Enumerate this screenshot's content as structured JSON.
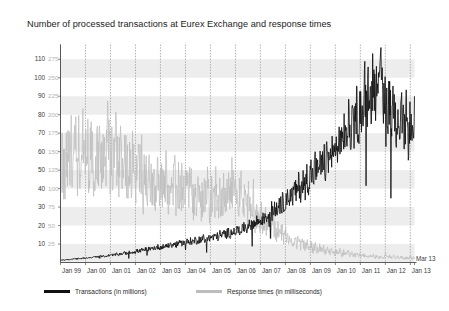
{
  "chart_data": {
    "type": "line",
    "title": "Number of processed transactions at Eurex Exchange and response times",
    "xlabel": "",
    "ylabel": "",
    "grid": true,
    "legend_position": "bottom",
    "axis_left": {
      "label": "Transactions (in millions)",
      "ticks": [
        10,
        20,
        30,
        40,
        50,
        60,
        70,
        80,
        90,
        100,
        110
      ],
      "ylim": [
        0,
        118
      ]
    },
    "axis_right": {
      "label": "Response times (in milliseconds)",
      "ticks": [
        25,
        50,
        75,
        100,
        125,
        150,
        175,
        200,
        225,
        250,
        275
      ],
      "ylim": [
        0,
        295
      ]
    },
    "x_ticks": [
      "Jan 99",
      "Jan 00",
      "Jan 01",
      "Jan 02",
      "Jan 03",
      "Jan 04",
      "Jan 05",
      "Jan 06",
      "Jan 07",
      "Jan 08",
      "Jan 09",
      "Jan 10",
      "Jan 11",
      "Jan 12",
      "Jan 13"
    ],
    "x_end_label": "Mar 13",
    "xlim": [
      "Jan 99",
      "Mar 13"
    ],
    "colors": {
      "transactions": "#111111",
      "response_times": "#bdbdbd",
      "band": "#ededed",
      "gridline": "#9a9a9a",
      "background": "#ffffff"
    },
    "series": [
      {
        "name": "Transactions (in millions)",
        "axis": "left",
        "color": "#111111",
        "unit": "millions",
        "values": [
          1.2,
          1.4,
          1.3,
          1.6,
          1.5,
          1.8,
          1.7,
          2.0,
          1.9,
          2.2,
          2.1,
          2.4,
          2.3,
          2.6,
          2.5,
          2.9,
          2.7,
          3.1,
          3.0,
          3.3,
          3.2,
          3.6,
          3.4,
          3.8,
          3.7,
          4.2,
          4.0,
          4.5,
          4.3,
          4.8,
          4.6,
          5.2,
          5.0,
          5.5,
          5.3,
          5.9,
          5.6,
          6.3,
          6.0,
          6.8,
          6.4,
          7.2,
          6.9,
          7.6,
          7.3,
          8.1,
          7.8,
          8.5,
          8.0,
          8.8,
          8.4,
          9.3,
          8.9,
          9.7,
          9.2,
          10.1,
          9.6,
          10.6,
          10.0,
          11.0,
          10.4,
          11.3,
          10.8,
          11.8,
          11.2,
          12.2,
          11.6,
          12.6,
          12.0,
          13.1,
          12.5,
          13.5,
          12.9,
          14.0,
          13.4,
          14.6,
          13.9,
          15.2,
          14.4,
          15.8,
          15.0,
          16.4,
          15.6,
          17.0,
          16.2,
          17.8,
          16.9,
          18.6,
          17.6,
          19.5,
          18.3,
          20.4,
          19.2,
          21.5,
          20.3,
          22.8,
          21.6,
          24.5,
          23.0,
          26.0,
          24.5,
          27.5,
          26.0,
          29.0,
          27.5,
          31.0,
          29.5,
          33.0,
          31.5,
          35.5,
          33.5,
          38.0,
          35.0,
          40.0,
          37.0,
          42.5,
          39.0,
          45.0,
          41.0,
          47.0,
          43.0,
          50.0,
          45.0,
          53.0,
          47.0,
          56.0,
          49.0,
          58.0,
          51.0,
          60.0,
          53.0,
          62.0,
          55.0,
          66.0,
          58.0,
          70.0,
          61.0,
          74.0,
          64.0,
          78.0,
          67.0,
          82.0,
          70.0,
          86.0,
          72.0,
          90.0,
          75.0,
          95.0,
          78.0,
          100.0,
          82.0,
          106.0,
          86.0,
          113.0,
          88.0,
          104.0,
          84.0,
          96.0,
          80.0,
          92.0,
          76.0,
          88.0,
          72.0,
          85.0,
          70.0,
          82.0,
          68.0,
          80.0,
          66.0,
          78.0,
          64.0,
          90.0
        ],
        "peak_value": 113,
        "peak_period": "Aug 2011",
        "end_value": 90,
        "start_value": 1.2
      },
      {
        "name": "Response times (in milliseconds)",
        "axis": "right",
        "color": "#bdbdbd",
        "unit": "milliseconds",
        "values": [
          120,
          135,
          118,
          150,
          128,
          160,
          140,
          175,
          132,
          155,
          145,
          168,
          138,
          158,
          126,
          172,
          130,
          148,
          142,
          165,
          122,
          152,
          136,
          170,
          128,
          145,
          134,
          162,
          118,
          140,
          125,
          155,
          112,
          132,
          120,
          148,
          105,
          128,
          115,
          138,
          98,
          120,
          108,
          130,
          95,
          118,
          102,
          125,
          90,
          112,
          96,
          120,
          88,
          108,
          92,
          115,
          85,
          105,
          90,
          112,
          82,
          100,
          88,
          108,
          80,
          98,
          85,
          104,
          78,
          95,
          82,
          100,
          76,
          92,
          80,
          98,
          74,
          90,
          78,
          96,
          80,
          100,
          88,
          112,
          92,
          118,
          86,
          108,
          78,
          95,
          70,
          86,
          64,
          78,
          58,
          72,
          52,
          66,
          48,
          60,
          44,
          55,
          40,
          50,
          36,
          46,
          33,
          42,
          30,
          38,
          28,
          35,
          26,
          33,
          24,
          30,
          22,
          28,
          20,
          26,
          18,
          24,
          17,
          22,
          16,
          20,
          15,
          19,
          14,
          18,
          13,
          17,
          12,
          16,
          11,
          15,
          10,
          14,
          10,
          13,
          9,
          12,
          9,
          12,
          8,
          11,
          8,
          11,
          7,
          10,
          7,
          10,
          7,
          9,
          6,
          9,
          6,
          9,
          6,
          8,
          6,
          8,
          5,
          8,
          5,
          7,
          5,
          7,
          5,
          7,
          5,
          7
        ],
        "peak_value": 175,
        "peak_period": "1999",
        "end_value": 7,
        "start_value": 120
      }
    ]
  },
  "legend": {
    "items": [
      {
        "label": "Transactions (in millions)",
        "color": "#111111"
      },
      {
        "label": "Response times (in milliseconds)",
        "color": "#bdbdbd"
      }
    ]
  }
}
